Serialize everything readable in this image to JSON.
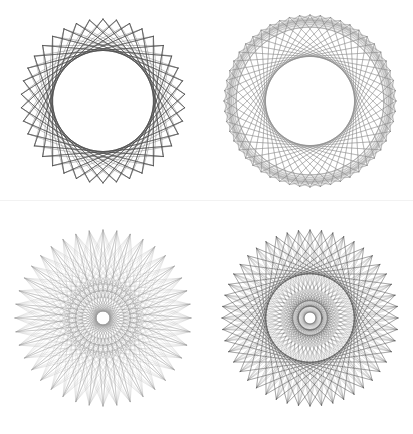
{
  "canvas": {
    "width": 413,
    "height": 434,
    "background": "#ffffff",
    "layout": "2x2-grid",
    "divider_color": "#f2f2f2"
  },
  "chart_data": {
    "type": "line",
    "title": "",
    "subtitle": "",
    "xlabel": "",
    "ylabel": "",
    "grid": false,
    "legend": "none",
    "panels": [
      {
        "id": "panel-top-left",
        "name": "dense-sunburst-star",
        "row": 1,
        "column": 1,
        "points": 38,
        "step": 11,
        "outer_radius": 82,
        "inner_envelope_ratio": 0.64,
        "center_x": 103,
        "center_y": 98,
        "stroke": "#4a4a4a",
        "stroke_width": 0.55,
        "opacity": 0.95,
        "lobes": 38,
        "appearance": "sharp radiating cusps around a large blank circular core"
      },
      {
        "id": "panel-top-right",
        "name": "rounded-polygon-ring",
        "row": 1,
        "column": 2,
        "points": 52,
        "step": 17,
        "outer_radius": 86,
        "inner_envelope_ratio": 0.86,
        "center_x": 309,
        "center_y": 100,
        "stroke": "#8a8a8a",
        "stroke_width": 0.5,
        "opacity": 0.85,
        "lobes": 17,
        "appearance": "banded ring of overlapping rounded polygons with a very large blank core"
      },
      {
        "id": "panel-bottom-left",
        "name": "thin-petal-rosette",
        "row": 2,
        "column": 1,
        "points": 40,
        "step": 19,
        "outer_radius": 88,
        "inner_envelope_ratio": 0.31,
        "center_x": 103,
        "center_y": 313,
        "stroke": "#9a9a9a",
        "stroke_width": 0.45,
        "opacity": 0.8,
        "lobes": 40,
        "appearance": "long narrow petals radiating from a small blank circular core"
      },
      {
        "id": "panel-bottom-right",
        "name": "dense-16-point-star",
        "row": 2,
        "column": 2,
        "points": 48,
        "step": 16,
        "outer_radius": 88,
        "inner_envelope_ratio": 0.14,
        "center_x": 309,
        "center_y": 313,
        "stroke": "#4f4f4f",
        "stroke_width": 0.45,
        "opacity": 0.75,
        "lobes": 16,
        "appearance": "heavily interwoven 16-pointed star with dense chord lattice and a small blank core"
      }
    ]
  }
}
